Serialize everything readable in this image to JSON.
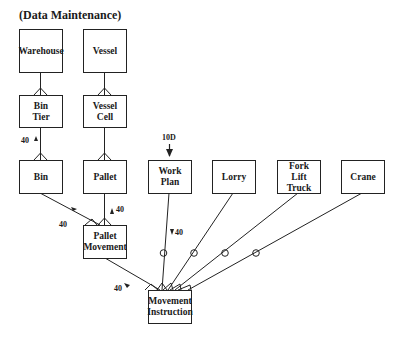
{
  "title": "(Data Maintenance)",
  "entities": {
    "warehouse": "Warehouse",
    "vessel": "Vessel",
    "bin_tier": "Bin\nTier",
    "vessel_cell": "Vessel\nCell",
    "bin": "Bin",
    "pallet": "Pallet",
    "work_plan": "Work\nPlan",
    "lorry": "Lorry",
    "fork_lift_truck": "Fork\nLift\nTruck",
    "crane": "Crane",
    "pallet_movement": "Pallet\nMovement",
    "movement_instruction": "Movement\nInstruction"
  },
  "annotations": {
    "bin_bintier": "40",
    "pallet_palletmovement": "40",
    "bin_palletmovement": "40",
    "workplan_in": "10D",
    "workplan_movement": "40",
    "palletmovement_movement": "40"
  },
  "relationships": [
    {
      "from": "Warehouse",
      "to": "Bin Tier",
      "type": "one-to-many"
    },
    {
      "from": "Vessel",
      "to": "Vessel Cell",
      "type": "one-to-many"
    },
    {
      "from": "Bin Tier",
      "to": "Bin",
      "type": "one-to-many"
    },
    {
      "from": "Vessel Cell",
      "to": "Pallet",
      "type": "one-to-many"
    },
    {
      "from": "Bin",
      "to": "Pallet Movement",
      "type": "one-to-many"
    },
    {
      "from": "Pallet",
      "to": "Pallet Movement",
      "type": "one-to-many"
    },
    {
      "from": "Pallet Movement",
      "to": "Movement Instruction",
      "type": "one-to-many"
    },
    {
      "from": "Work Plan",
      "to": "Movement Instruction",
      "type": "optional-one-to-many"
    },
    {
      "from": "Lorry",
      "to": "Movement Instruction",
      "type": "optional-one-to-many"
    },
    {
      "from": "Fork Lift Truck",
      "to": "Movement Instruction",
      "type": "optional-one-to-many"
    },
    {
      "from": "Crane",
      "to": "Movement Instruction",
      "type": "optional-one-to-many"
    }
  ]
}
